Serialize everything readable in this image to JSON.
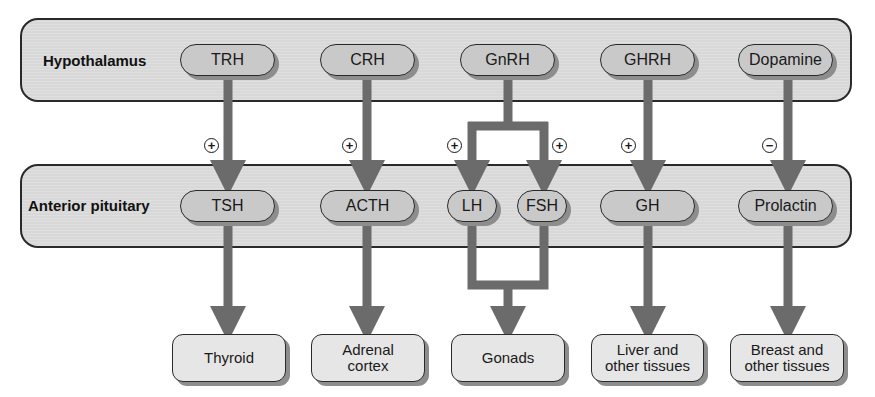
{
  "diagram": {
    "layers": {
      "hypothalamus": {
        "label": "Hypothalamus",
        "hormones": [
          "TRH",
          "CRH",
          "GnRH",
          "GHRH",
          "Dopamine"
        ]
      },
      "anterior_pituitary": {
        "label": "Anterior pituitary",
        "hormones": [
          "TSH",
          "ACTH",
          "LH",
          "FSH",
          "GH",
          "Prolactin"
        ]
      }
    },
    "effects": [
      {
        "from": "TRH",
        "to": "TSH",
        "sign": "+"
      },
      {
        "from": "CRH",
        "to": "ACTH",
        "sign": "+"
      },
      {
        "from": "GnRH",
        "to": "LH",
        "sign": "+"
      },
      {
        "from": "GnRH",
        "to": "FSH",
        "sign": "+"
      },
      {
        "from": "GHRH",
        "to": "GH",
        "sign": "+"
      },
      {
        "from": "Dopamine",
        "to": "Prolactin",
        "sign": "−"
      }
    ],
    "targets": [
      {
        "name": "thyroid",
        "line1": "Thyroid",
        "line2": ""
      },
      {
        "name": "adrenal-cortex",
        "line1": "Adrenal",
        "line2": "cortex"
      },
      {
        "name": "gonads",
        "line1": "Gonads",
        "line2": ""
      },
      {
        "name": "liver",
        "line1": "Liver and",
        "line2": "other tissues"
      },
      {
        "name": "breast",
        "line1": "Breast and",
        "line2": "other tissues"
      }
    ],
    "colors": {
      "panel_fill": "#d8d8d8",
      "pill_fill": "#c9c9c9",
      "target_fill": "#e6e6e6",
      "arrow": "#6b6b6b",
      "outline": "#2a2a2a"
    }
  }
}
